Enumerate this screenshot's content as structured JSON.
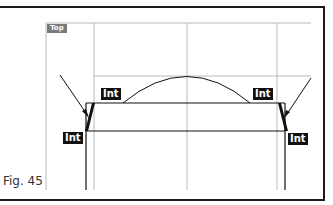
{
  "figure": {
    "caption": "Fig. 45",
    "viewport_label": "Top",
    "snap_labels": [
      {
        "id": "int-top-left",
        "text": "Int",
        "x": 101,
        "y": 88
      },
      {
        "id": "int-top-right",
        "text": "Int",
        "x": 253,
        "y": 88
      },
      {
        "id": "int-bottom-left",
        "text": "Int",
        "x": 63,
        "y": 132
      },
      {
        "id": "int-bottom-right",
        "text": "Int",
        "x": 288,
        "y": 133
      }
    ],
    "colors": {
      "frame": "#1a1a1a",
      "gridline": "#9a9a9a",
      "geometry": "#111111",
      "label_bg": "#7a7a7a",
      "tag_bg": "#111111"
    }
  }
}
